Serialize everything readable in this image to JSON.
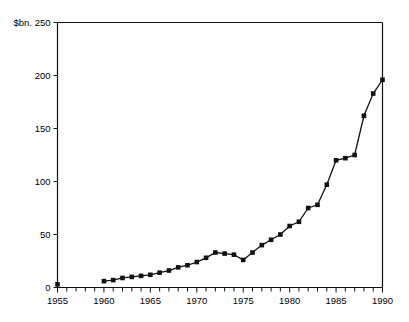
{
  "chart_data": {
    "type": "line",
    "title": "",
    "subtitle": "",
    "xlabel": "",
    "ylabel": "$bn.",
    "ylabel_display": "$bn. 250",
    "xlim": [
      1955,
      1990
    ],
    "ylim": [
      0,
      250
    ],
    "grid": false,
    "legend": null,
    "marker": "square",
    "y_ticks": [
      0,
      50,
      100,
      150,
      200,
      250
    ],
    "y_tick_labels": [
      "0",
      "50",
      "100",
      "150",
      "200",
      "$bn. 250"
    ],
    "x_ticks": [
      1955,
      1956,
      1957,
      1958,
      1959,
      1960,
      1961,
      1962,
      1963,
      1964,
      1965,
      1966,
      1967,
      1968,
      1969,
      1970,
      1971,
      1972,
      1973,
      1974,
      1975,
      1976,
      1977,
      1978,
      1979,
      1980,
      1981,
      1982,
      1983,
      1984,
      1985,
      1986,
      1987,
      1988,
      1989,
      1990
    ],
    "x_tick_labels": [
      "1955",
      "1960",
      "1965",
      "1970",
      "1975",
      "1980",
      "1985",
      "1990"
    ],
    "x_labeled_ticks": [
      1955,
      1960,
      1965,
      1970,
      1975,
      1980,
      1985,
      1990
    ],
    "series": [
      {
        "name": "isolated-1955-point",
        "connected": false,
        "x": [
          1955
        ],
        "values": [
          3
        ]
      },
      {
        "name": "main-series",
        "connected": true,
        "x": [
          1960,
          1961,
          1962,
          1963,
          1964,
          1965,
          1966,
          1967,
          1968,
          1969,
          1970,
          1971,
          1972,
          1973,
          1974,
          1975,
          1976,
          1977,
          1978,
          1979,
          1980,
          1981,
          1982,
          1983,
          1984,
          1985,
          1986,
          1987,
          1988,
          1989,
          1990
        ],
        "values": [
          6,
          7,
          9,
          10,
          11,
          12,
          14,
          16,
          19,
          21,
          24,
          28,
          33,
          32,
          31,
          26,
          33,
          40,
          45,
          50,
          58,
          62,
          75,
          78,
          97,
          120,
          122,
          125,
          162,
          183,
          196
        ]
      }
    ],
    "colors": {
      "line": "#111111",
      "marker": "#111111",
      "axis": "#111111",
      "background": "#ffffff"
    }
  }
}
